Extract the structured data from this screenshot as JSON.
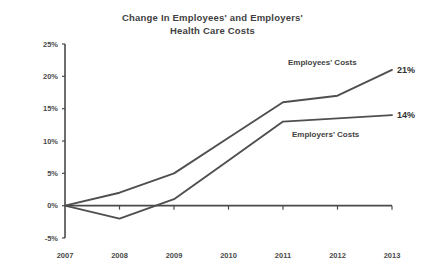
{
  "chart_data": {
    "type": "line",
    "title": "Change In Employees' and Employers'\nHealth Care Costs",
    "xlabel": "",
    "ylabel": "",
    "categories": [
      "2007",
      "2008",
      "2009",
      "2010",
      "2011",
      "2012",
      "2013"
    ],
    "x": [
      2007,
      2008,
      2009,
      2010,
      2011,
      2012,
      2013
    ],
    "series": [
      {
        "name": "Employees' Costs",
        "values": [
          0,
          2,
          5,
          10.5,
          16,
          17,
          21
        ],
        "end_label": "21%",
        "color": "#4f4f4f"
      },
      {
        "name": "Employers' Costs",
        "values": [
          0,
          -2,
          1,
          7,
          13,
          13.5,
          14
        ],
        "end_label": "14%",
        "color": "#4f4f4f"
      }
    ],
    "ylim": [
      -5,
      25
    ],
    "ytick_values": [
      -5,
      0,
      5,
      10,
      15,
      20,
      25
    ],
    "ytick_labels": [
      "-5%",
      "0%",
      "5%",
      "10%",
      "15%",
      "20%",
      "25%"
    ],
    "grid": false,
    "legend_position": "inline-annotations",
    "annotations": [
      {
        "text": "Employees' Costs",
        "series": "Employees' Costs"
      },
      {
        "text": "Employers' Costs",
        "series": "Employers' Costs"
      }
    ]
  },
  "colors": {
    "line": "#4f4f4f",
    "axis": "#4a4a4a",
    "text": "#3f3f3f",
    "background": "#ffffff"
  }
}
